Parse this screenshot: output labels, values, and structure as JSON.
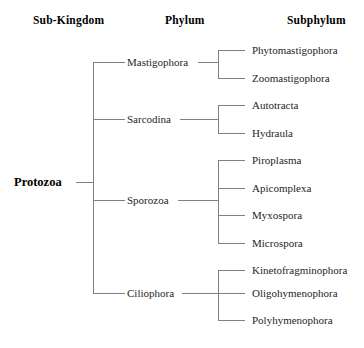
{
  "headers": [
    {
      "label": "Sub-Kingdom",
      "x": 33,
      "y": 14
    },
    {
      "label": "Phylum",
      "x": 165,
      "y": 14
    },
    {
      "label": "Subphylum",
      "x": 287,
      "y": 14
    }
  ],
  "root": {
    "label": "Protozoa",
    "x": 14,
    "y": 182
  },
  "phyla": [
    {
      "label": "Mastigophora",
      "x": 127,
      "y": 62
    },
    {
      "label": "Sarcodina",
      "x": 127,
      "y": 119
    },
    {
      "label": "Sporozoa",
      "x": 127,
      "y": 200
    },
    {
      "label": "Ciliophora",
      "x": 127,
      "y": 293
    }
  ],
  "subphyla": [
    {
      "label": "Phytomastigophora",
      "x": 252,
      "y": 50,
      "parent": "Mastigophora"
    },
    {
      "label": "Zoomastigophora",
      "x": 252,
      "y": 78,
      "parent": "Mastigophora"
    },
    {
      "label": "Autotracta",
      "x": 252,
      "y": 105,
      "parent": "Sarcodina"
    },
    {
      "label": "Hydraula",
      "x": 252,
      "y": 133,
      "parent": "Sarcodina"
    },
    {
      "label": "Piroplasma",
      "x": 252,
      "y": 160,
      "parent": "Sporozoa"
    },
    {
      "label": "Apicomplexa",
      "x": 252,
      "y": 188,
      "parent": "Sporozoa"
    },
    {
      "label": "Myxospora",
      "x": 252,
      "y": 215,
      "parent": "Sporozoa"
    },
    {
      "label": "Microspora",
      "x": 252,
      "y": 243,
      "parent": "Sporozoa"
    },
    {
      "label": "Kinetofragminophora",
      "x": 252,
      "y": 270,
      "parent": "Ciliophora"
    },
    {
      "label": "Oligohymenophora",
      "x": 252,
      "y": 293,
      "parent": "Ciliophora"
    },
    {
      "label": "Polyhymenophora",
      "x": 252,
      "y": 320,
      "parent": "Ciliophora"
    }
  ],
  "colors": {
    "line": "#808080",
    "text": "#262626",
    "heading": "#000000",
    "background": "#ffffff"
  }
}
